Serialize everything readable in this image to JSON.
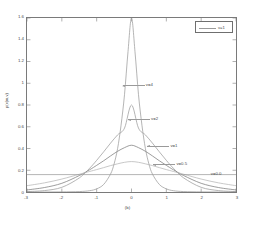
{
  "chart_data": {
    "type": "line",
    "title": "",
    "xlabel": "(b)",
    "ylabel": "p(x|m,v)",
    "xlim": [
      -3,
      3
    ],
    "ylim": [
      0,
      1.6
    ],
    "xticks": [
      "-3",
      "-2",
      "-1",
      "0",
      "1",
      "2",
      "3"
    ],
    "xtick_values": [
      -3,
      -2,
      -1,
      0,
      1,
      2,
      3
    ],
    "yticks": [
      "0",
      "0.2",
      "0.4",
      "0.6",
      "0.8",
      "1",
      "1.2",
      "1.4",
      "1.6"
    ],
    "ytick_values": [
      0,
      0.2,
      0.4,
      0.6,
      0.8,
      1.0,
      1.2,
      1.4,
      1.6
    ],
    "grid": false,
    "legend_position": "upper-right",
    "legend": [
      "v=1"
    ],
    "series": [
      {
        "name": "v=4",
        "annotation": "v=4",
        "peak_value": 1.6,
        "scale": 0.25,
        "color": "#9a9a9a",
        "x": [
          -3,
          -2.5,
          -2,
          -1.5,
          -1.2,
          -1,
          -0.8,
          -0.6,
          -0.5,
          -0.4,
          -0.3,
          -0.2,
          -0.1,
          0,
          0.1,
          0.2,
          0.3,
          0.4,
          0.5,
          0.6,
          0.8,
          1,
          1.2,
          1.5,
          2,
          2.5,
          3
        ],
        "y": [
          0.0,
          0.0,
          0.001,
          0.004,
          0.012,
          0.029,
          0.069,
          0.166,
          0.258,
          0.398,
          0.614,
          0.898,
          1.291,
          1.6,
          1.291,
          0.898,
          0.614,
          0.398,
          0.258,
          0.166,
          0.069,
          0.029,
          0.012,
          0.004,
          0.001,
          0.0,
          0.0
        ]
      },
      {
        "name": "v=2",
        "annotation": "v=2",
        "peak_value": 0.8,
        "scale": 0.5,
        "color": "#9a9a9a",
        "x": [
          -3,
          -2.5,
          -2,
          -1.5,
          -1.2,
          -1,
          -0.8,
          -0.6,
          -0.4,
          -0.2,
          0,
          0.2,
          0.4,
          0.6,
          0.8,
          1,
          1.2,
          1.5,
          2,
          2.5,
          3
        ],
        "y": [
          0.004,
          0.013,
          0.043,
          0.129,
          0.219,
          0.291,
          0.369,
          0.45,
          0.525,
          0.588,
          0.8,
          0.588,
          0.525,
          0.45,
          0.369,
          0.291,
          0.219,
          0.129,
          0.043,
          0.013,
          0.004
        ]
      },
      {
        "name": "v=1",
        "annotation": "v=1",
        "peak_value": 0.43,
        "scale": 0.93,
        "color": "#7a7a7a",
        "x": [
          -3,
          -2.5,
          -2,
          -1.5,
          -1.2,
          -1,
          -0.8,
          -0.6,
          -0.4,
          -0.2,
          0,
          0.2,
          0.4,
          0.6,
          0.8,
          1,
          1.2,
          1.5,
          2,
          2.5,
          3
        ],
        "y": [
          0.019,
          0.041,
          0.08,
          0.151,
          0.205,
          0.245,
          0.287,
          0.332,
          0.374,
          0.408,
          0.43,
          0.408,
          0.374,
          0.332,
          0.287,
          0.245,
          0.205,
          0.151,
          0.08,
          0.041,
          0.019
        ]
      },
      {
        "name": "v=0.5",
        "annotation": "v=0.5",
        "peak_value": 0.28,
        "scale": 1.45,
        "color": "#b5b5b5",
        "x": [
          -3,
          -2.5,
          -2,
          -1.5,
          -1.2,
          -1,
          -0.8,
          -0.6,
          -0.4,
          -0.2,
          0,
          0.2,
          0.4,
          0.6,
          0.8,
          1,
          1.2,
          1.5,
          2,
          2.5,
          3
        ],
        "y": [
          0.058,
          0.084,
          0.119,
          0.163,
          0.189,
          0.206,
          0.224,
          0.243,
          0.259,
          0.273,
          0.28,
          0.273,
          0.259,
          0.243,
          0.224,
          0.206,
          0.189,
          0.163,
          0.119,
          0.084,
          0.058
        ]
      },
      {
        "name": "v=0.0",
        "annotation": "v=0.0",
        "peak_value": 0.16,
        "scale": 0,
        "color": "#9a9a9a",
        "x": [
          -3,
          3
        ],
        "y": [
          0.16,
          0.16
        ]
      }
    ],
    "annotations": [
      {
        "label": "v=4",
        "x_data": 0.35,
        "y_data": 0.98
      },
      {
        "label": "v=2",
        "x_data": 0.5,
        "y_data": 0.67
      },
      {
        "label": "v=1",
        "x_data": 1.05,
        "y_data": 0.43
      },
      {
        "label": "v=0.5",
        "x_data": 1.22,
        "y_data": 0.26
      },
      {
        "label": "v=0.0",
        "x_data": 2.2,
        "y_data": 0.175
      }
    ]
  }
}
